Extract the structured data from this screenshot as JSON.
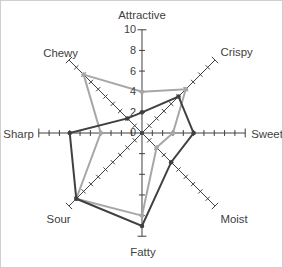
{
  "figure": {
    "background": "#ffffff",
    "border_color": "#cfcfcf"
  },
  "chart_data": {
    "type": "radar",
    "title": "",
    "categories": [
      "Attractive",
      "Crispy",
      "Sweet",
      "Moist",
      "Fatty",
      "Sour",
      "Sharp",
      "Chewy"
    ],
    "series": [
      {
        "name": "gray-profile",
        "color": "#a6a6a6",
        "values": [
          4,
          6,
          3,
          2,
          8,
          9,
          4,
          8
        ]
      },
      {
        "name": "dark-profile",
        "color": "#404040",
        "values": [
          2,
          5,
          5,
          4,
          9,
          9,
          7,
          2
        ]
      }
    ],
    "radial_axis": {
      "min": 0,
      "max": 10,
      "tick_labels": [
        "10",
        "8",
        "6",
        "4",
        "2",
        "0"
      ],
      "labeled_step": 2,
      "minor_tick_step": 1
    },
    "axis_color": "#404040",
    "label_color": "#404040",
    "grid": false,
    "legend_position": "none"
  }
}
